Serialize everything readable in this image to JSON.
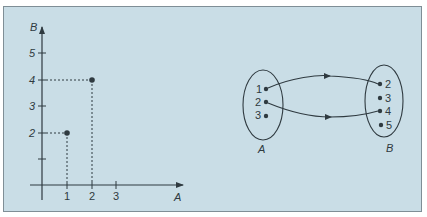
{
  "figure": {
    "panel_color": "#c9dde6",
    "ink_color": "#2f3a40"
  },
  "graph": {
    "x_axis_label": "A",
    "y_axis_label": "B",
    "x_ticks": [
      "1",
      "2",
      "3"
    ],
    "y_ticks": [
      "2",
      "3",
      "4",
      "5"
    ],
    "points": [
      {
        "x": 1,
        "y": 2
      },
      {
        "x": 2,
        "y": 4
      }
    ]
  },
  "mapping": {
    "domain_label": "A",
    "codomain_label": "B",
    "domain_elements": [
      "1",
      "2",
      "3"
    ],
    "codomain_elements": [
      "2",
      "3",
      "4",
      "5"
    ],
    "arrows": [
      {
        "from": "1",
        "to": "2"
      },
      {
        "from": "2",
        "to": "4"
      }
    ]
  }
}
